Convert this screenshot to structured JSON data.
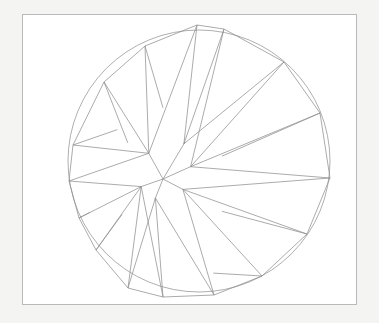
{
  "figure": {
    "type": "line-diagram",
    "canvas": {
      "width": 379,
      "height": 323
    },
    "colors": {
      "page_background": "#f4f4f3",
      "panel_background": "#ffffff",
      "frame_stroke": "#b9b9b9",
      "circle_stroke": "#9a9a9a",
      "ray_stroke": "#8f8f8f"
    },
    "frame": {
      "x": 22,
      "y": 14,
      "width": 335,
      "height": 291
    },
    "circle": {
      "cx": 199,
      "cy": 161,
      "r": 131
    },
    "center_node": {
      "x": 163,
      "y": 179
    },
    "star": {
      "points": 16,
      "description": "Sixteen irregular rays radiating from an off-centre hub to the circumference, each ray drawn as a thin triangular spike bounded by two straight edges.",
      "hub_polygon": [
        [
          163,
          179
        ],
        [
          148,
          152
        ],
        [
          185,
          142
        ],
        [
          192,
          166
        ],
        [
          184,
          190
        ],
        [
          155,
          199
        ],
        [
          140,
          187
        ]
      ],
      "rays": [
        {
          "name": "ray-n",
          "tip": [
            197,
            25
          ],
          "base_a": [
            185,
            142
          ],
          "base_b": [
            148,
            152
          ]
        },
        {
          "name": "ray-nne",
          "tip": [
            224,
            29
          ],
          "base_a": [
            192,
            166
          ],
          "base_b": [
            185,
            142
          ]
        },
        {
          "name": "ray-ne",
          "tip": [
            284,
            62
          ],
          "base_a": [
            192,
            166
          ],
          "base_b": [
            185,
            142
          ]
        },
        {
          "name": "ray-ene",
          "tip": [
            320,
            113
          ],
          "base_a": [
            192,
            166
          ],
          "base_b": [
            225,
            155
          ]
        },
        {
          "name": "ray-e",
          "tip": [
            330,
            178
          ],
          "base_a": [
            184,
            190
          ],
          "base_b": [
            192,
            166
          ]
        },
        {
          "name": "ray-ese",
          "tip": [
            307,
            234
          ],
          "base_a": [
            184,
            190
          ],
          "base_b": [
            225,
            213
          ]
        },
        {
          "name": "ray-se",
          "tip": [
            262,
            276
          ],
          "base_a": [
            184,
            190
          ],
          "base_b": [
            216,
            278
          ]
        },
        {
          "name": "ray-sse",
          "tip": [
            214,
            295
          ],
          "base_a": [
            184,
            190
          ],
          "base_b": [
            155,
            199
          ]
        },
        {
          "name": "ray-s",
          "tip": [
            163,
            297
          ],
          "base_a": [
            155,
            199
          ],
          "base_b": [
            140,
            187
          ]
        },
        {
          "name": "ray-ssw",
          "tip": [
            128,
            288
          ],
          "base_a": [
            155,
            199
          ],
          "base_b": [
            140,
            187
          ]
        },
        {
          "name": "ray-sw",
          "tip": [
            96,
            250
          ],
          "base_a": [
            140,
            187
          ],
          "base_b": [
            120,
            216
          ]
        },
        {
          "name": "ray-wsw",
          "tip": [
            79,
            218
          ],
          "base_a": [
            140,
            187
          ],
          "base_b": [
            86,
            214
          ]
        },
        {
          "name": "ray-w",
          "tip": [
            69,
            181
          ],
          "base_a": [
            140,
            187
          ],
          "base_b": [
            148,
            152
          ]
        },
        {
          "name": "ray-wnw",
          "tip": [
            73,
            145
          ],
          "base_a": [
            148,
            152
          ],
          "base_b": [
            115,
            127
          ]
        },
        {
          "name": "ray-nw",
          "tip": [
            104,
            82
          ],
          "base_a": [
            148,
            152
          ],
          "base_b": [
            126,
            141
          ]
        },
        {
          "name": "ray-nnw",
          "tip": [
            145,
            46
          ],
          "base_a": [
            148,
            152
          ],
          "base_b": [
            163,
            104
          ]
        }
      ]
    }
  },
  "chart_data": {
    "type": "scatter",
    "xlabel": "",
    "ylabel": "",
    "xlim": [
      0,
      379
    ],
    "ylim": [
      0,
      323
    ],
    "grid": false,
    "legend": null,
    "annotations": [],
    "series": [
      {
        "name": "ray-tips",
        "description": "Polar positions of the 16 ray tips on the bounding circle, measured as compass bearings clockwise from north.",
        "x": [
          197,
          224,
          284,
          320,
          330,
          307,
          262,
          214,
          163,
          128,
          96,
          79,
          69,
          73,
          104,
          145
        ],
        "y": [
          25,
          29,
          62,
          113,
          178,
          234,
          276,
          295,
          297,
          288,
          250,
          218,
          181,
          145,
          82,
          46
        ],
        "bearings_deg": [
          0,
          11,
          40,
          62,
          87,
          112,
          136,
          159,
          186,
          207,
          230,
          249,
          269,
          289,
          315,
          341
        ],
        "radii_px": [
          136,
          132,
          132,
          132,
          131,
          131,
          135,
          134,
          136,
          142,
          139,
          130,
          131,
          128,
          118,
          124
        ]
      }
    ]
  }
}
